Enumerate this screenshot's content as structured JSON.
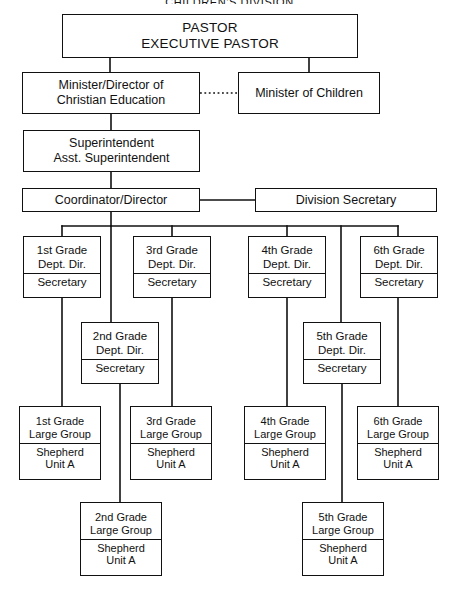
{
  "chart": {
    "title": "CHILDREN'S DIVISION",
    "type": "organizational-chart",
    "line_color": "#111111",
    "background": "#ffffff"
  },
  "nodes": {
    "pastor": {
      "id": "pastor",
      "lines": [
        "PASTOR",
        "EXECUTIVE PASTOR"
      ],
      "x": 62,
      "y": 14,
      "w": 296,
      "h": 44,
      "size": "sz-top"
    },
    "minister_ce": {
      "id": "minister-of-christian-education",
      "lines": [
        "Minister/Director of",
        "Christian Education"
      ],
      "x": 22,
      "y": 72,
      "w": 178,
      "h": 42,
      "size": "sz-mid"
    },
    "minister_children": {
      "id": "minister-of-children",
      "lines": [
        "Minister of Children"
      ],
      "x": 238,
      "y": 72,
      "w": 142,
      "h": 42,
      "size": "sz-mid"
    },
    "superintendent": {
      "id": "superintendent",
      "lines": [
        "Superintendent",
        "Asst. Superintendent"
      ],
      "x": 23,
      "y": 130,
      "w": 177,
      "h": 42,
      "size": "sz-mid"
    },
    "coordinator": {
      "id": "coordinator-director",
      "lines": [
        "Coordinator/Director"
      ],
      "x": 22,
      "y": 188,
      "w": 178,
      "h": 24,
      "size": "sz-mid"
    },
    "division_secretary": {
      "id": "division-secretary",
      "lines": [
        "Division Secretary"
      ],
      "x": 255,
      "y": 188,
      "w": 182,
      "h": 24,
      "size": "sz-mid"
    },
    "g1_dept": {
      "id": "grade-1-dept-director",
      "head": [
        "1st Grade",
        "Dept. Dir."
      ],
      "sub": [
        "Secretary"
      ],
      "x": 23,
      "y": 236,
      "w": 78,
      "h": 62,
      "size": "sz-small"
    },
    "g3_dept": {
      "id": "grade-3-dept-director",
      "head": [
        "3rd Grade",
        "Dept. Dir."
      ],
      "sub": [
        "Secretary"
      ],
      "x": 133,
      "y": 236,
      "w": 78,
      "h": 62,
      "size": "sz-small"
    },
    "g4_dept": {
      "id": "grade-4-dept-director",
      "head": [
        "4th Grade",
        "Dept. Dir."
      ],
      "sub": [
        "Secretary"
      ],
      "x": 248,
      "y": 236,
      "w": 78,
      "h": 62,
      "size": "sz-small"
    },
    "g6_dept": {
      "id": "grade-6-dept-director",
      "head": [
        "6th Grade",
        "Dept. Dir."
      ],
      "sub": [
        "Secretary"
      ],
      "x": 360,
      "y": 236,
      "w": 78,
      "h": 62,
      "size": "sz-small"
    },
    "g2_dept": {
      "id": "grade-2-dept-director",
      "head": [
        "2nd Grade",
        "Dept. Dir."
      ],
      "sub": [
        "Secretary"
      ],
      "x": 81,
      "y": 322,
      "w": 78,
      "h": 62,
      "size": "sz-small"
    },
    "g5_dept": {
      "id": "grade-5-dept-director",
      "head": [
        "5th Grade",
        "Dept. Dir."
      ],
      "sub": [
        "Secretary"
      ],
      "x": 303,
      "y": 322,
      "w": 78,
      "h": 62,
      "size": "sz-small"
    },
    "g1_group": {
      "id": "grade-1-large-group",
      "head": [
        "1st Grade",
        "Large Group"
      ],
      "sub": [
        "Shepherd",
        "Unit A"
      ],
      "x": 19,
      "y": 406,
      "w": 82,
      "h": 74,
      "size": "sz-leaf"
    },
    "g3_group": {
      "id": "grade-3-large-group",
      "head": [
        "3rd Grade",
        "Large Group"
      ],
      "sub": [
        "Shepherd",
        "Unit A"
      ],
      "x": 130,
      "y": 406,
      "w": 82,
      "h": 74,
      "size": "sz-leaf"
    },
    "g4_group": {
      "id": "grade-4-large-group",
      "head": [
        "4th Grade",
        "Large Group"
      ],
      "sub": [
        "Shepherd",
        "Unit A"
      ],
      "x": 244,
      "y": 406,
      "w": 82,
      "h": 74,
      "size": "sz-leaf"
    },
    "g6_group": {
      "id": "grade-6-large-group",
      "head": [
        "6th Grade",
        "Large Group"
      ],
      "sub": [
        "Shepherd",
        "Unit A"
      ],
      "x": 357,
      "y": 406,
      "w": 82,
      "h": 74,
      "size": "sz-leaf"
    },
    "g2_group": {
      "id": "grade-2-large-group",
      "head": [
        "2nd Grade",
        "Large Group"
      ],
      "sub": [
        "Shepherd",
        "Unit A"
      ],
      "x": 80,
      "y": 502,
      "w": 82,
      "h": 74,
      "size": "sz-leaf"
    },
    "g5_group": {
      "id": "grade-5-large-group",
      "head": [
        "5th Grade",
        "Large Group"
      ],
      "sub": [
        "Shepherd",
        "Unit A"
      ],
      "x": 302,
      "y": 502,
      "w": 82,
      "h": 74,
      "size": "sz-leaf"
    }
  },
  "connectors": {
    "solid": [
      "M110,58 L110,72",
      "M309,58 L309,72",
      "M111,114 L111,130",
      "M111,172 L111,188",
      "M200,200 L255,200",
      "M111,212 L111,226",
      "M62,226 L398,226",
      "M62,226 L62,236",
      "M111,226 L111,322",
      "M172,226 L172,236",
      "M287,226 L287,236",
      "M341,226 L341,322",
      "M398,226 L398,236",
      "M62,298 L62,406",
      "M172,298 L172,406",
      "M287,298 L287,406",
      "M398,298 L398,406",
      "M120,384 L120,502",
      "M342,384 L342,502"
    ],
    "dotted": [
      "M200,93 L238,93"
    ]
  }
}
